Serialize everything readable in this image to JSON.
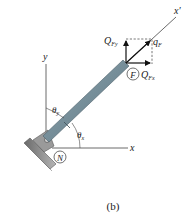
{
  "figure": {
    "caption": "(b)",
    "axes": {
      "x_label": "x",
      "y_label": "y",
      "x_prime_label": "x",
      "x_prime_mark": "′"
    },
    "points": {
      "F": "F",
      "N": "N"
    },
    "forces": {
      "qF_main": "q",
      "qF_sub": "F",
      "QFy_main": "Q",
      "QFy_sub": "Fy",
      "QFx_main": "Q",
      "QFx_sub": "Fx"
    },
    "angles": {
      "theta_y_main": "θ",
      "theta_y_sub": "y",
      "theta_x_main": "θ",
      "theta_x_sub": "x"
    },
    "colors": {
      "rod": "#6f8a96",
      "rod_edge": "#4e626b",
      "support": "#8c8c8c",
      "line": "#333333",
      "dashed": "#555555"
    }
  }
}
